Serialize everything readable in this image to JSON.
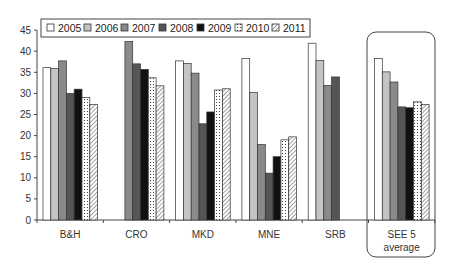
{
  "chart_data": {
    "type": "bar",
    "title": "",
    "xlabel": "",
    "ylabel": "",
    "ylim": [
      0,
      45
    ],
    "yticks": [
      0,
      5,
      10,
      15,
      20,
      25,
      30,
      35,
      40,
      45
    ],
    "grid": false,
    "legend_position": "top-left, inside",
    "categories": [
      "B&H",
      "CRO",
      "MKD",
      "MNE",
      "SRB",
      "SEE 5 average"
    ],
    "highlighted_category": "SEE 5 average",
    "series": [
      {
        "name": "2005",
        "style": "white",
        "values": [
          36.1,
          null,
          37.7,
          38.3,
          41.9,
          38.3
        ]
      },
      {
        "name": "2006",
        "style": "light-gray",
        "values": [
          35.9,
          null,
          37.1,
          30.2,
          37.8,
          35.1
        ]
      },
      {
        "name": "2007",
        "style": "mid-gray",
        "values": [
          37.7,
          42.3,
          34.8,
          17.9,
          31.9,
          32.7
        ]
      },
      {
        "name": "2008",
        "style": "dark-gray",
        "values": [
          30.0,
          37.0,
          22.8,
          11.1,
          33.9,
          26.8
        ]
      },
      {
        "name": "2009",
        "style": "black",
        "values": [
          31.0,
          35.7,
          25.6,
          15.0,
          null,
          26.6
        ]
      },
      {
        "name": "2010",
        "style": "dotted",
        "values": [
          29.0,
          33.7,
          30.8,
          19.0,
          null,
          28.0
        ]
      },
      {
        "name": "2011",
        "style": "hatched",
        "values": [
          27.4,
          31.8,
          31.1,
          19.7,
          null,
          27.4
        ]
      }
    ]
  },
  "legend": {
    "items": [
      "2005",
      "2006",
      "2007",
      "2008",
      "2009",
      "2010",
      "2011"
    ]
  },
  "axis": {
    "y_ticks": [
      "0",
      "5",
      "10",
      "15",
      "20",
      "25",
      "30",
      "35",
      "40",
      "45"
    ]
  },
  "categories": {
    "labels": [
      "B&H",
      "CRO",
      "MKD",
      "MNE",
      "SRB",
      "SEE 5"
    ],
    "see5_second_line": "average"
  },
  "colors": {
    "2005": "#ffffff",
    "2006": "#c4c4c4",
    "2007": "#8a8a8a",
    "2008": "#555555",
    "2009": "#111111",
    "2010": "#ffffff",
    "2011": "#ffffff",
    "stroke": "#333333"
  }
}
